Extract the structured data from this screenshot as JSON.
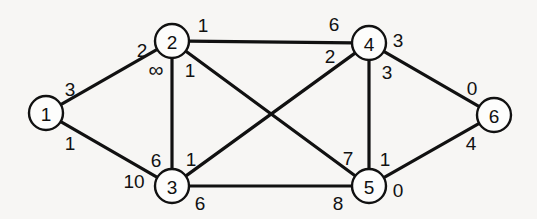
{
  "figure": {
    "type": "undirected-weighted-graph",
    "background_color": "#f7f6f4",
    "stroke_color": "#111111",
    "node_fill_color": "#fdfdfc"
  },
  "chart_data": {
    "type": "diagram",
    "title": "",
    "xlabel": "",
    "ylabel": "",
    "nodes": [
      {
        "id": "1",
        "label": "1",
        "x": 46,
        "y": 113,
        "r": 17
      },
      {
        "id": "2",
        "label": "2",
        "x": 172,
        "y": 41,
        "r": 17
      },
      {
        "id": "3",
        "label": "3",
        "x": 172,
        "y": 186,
        "r": 17
      },
      {
        "id": "4",
        "label": "4",
        "x": 369,
        "y": 43,
        "r": 17
      },
      {
        "id": "5",
        "label": "5",
        "x": 369,
        "y": 186,
        "r": 17
      },
      {
        "id": "6",
        "label": "6",
        "x": 494,
        "y": 115,
        "r": 17
      }
    ],
    "edges": [
      {
        "id": "edge-1-2",
        "from": "1",
        "to": "2",
        "label_from": "3",
        "label_to": "2"
      },
      {
        "id": "edge-1-3",
        "from": "1",
        "to": "3",
        "label_from": "1",
        "label_to": "10"
      },
      {
        "id": "edge-2-3",
        "from": "2",
        "to": "3",
        "label_from": "∞",
        "label_to": "6"
      },
      {
        "id": "edge-2-4",
        "from": "2",
        "to": "4",
        "label_from": "1",
        "label_to": "6"
      },
      {
        "id": "edge-2-5",
        "from": "2",
        "to": "5",
        "label_from": "1",
        "label_to": "7"
      },
      {
        "id": "edge-3-4",
        "from": "3",
        "to": "4",
        "label_from": "1",
        "label_to": "2"
      },
      {
        "id": "edge-3-5",
        "from": "3",
        "to": "5",
        "label_from": "6",
        "label_to": "8"
      },
      {
        "id": "edge-4-5",
        "from": "4",
        "to": "5",
        "label_from": "3",
        "label_to": "1"
      },
      {
        "id": "edge-4-6",
        "from": "4",
        "to": "6",
        "label_from": "3",
        "label_to": "0"
      },
      {
        "id": "edge-5-6",
        "from": "5",
        "to": "6",
        "label_from": "0",
        "label_to": "4"
      }
    ],
    "weight_labels": [
      {
        "id": "w-1-2-near1",
        "text": "3",
        "x": 70,
        "y": 89,
        "edge": "edge-1-2"
      },
      {
        "id": "w-1-2-near2",
        "text": "2",
        "x": 142,
        "y": 50,
        "edge": "edge-1-2"
      },
      {
        "id": "w-1-3-near1",
        "text": "1",
        "x": 70,
        "y": 143,
        "edge": "edge-1-3"
      },
      {
        "id": "w-1-3-near3",
        "text": "10",
        "x": 134,
        "y": 181,
        "edge": "edge-1-3"
      },
      {
        "id": "w-2-3-near2",
        "text": "∞",
        "x": 156,
        "y": 69,
        "edge": "edge-2-3"
      },
      {
        "id": "w-2-3-near3",
        "text": "6",
        "x": 156,
        "y": 160,
        "edge": "edge-2-3"
      },
      {
        "id": "w-2-4-near2",
        "text": "1",
        "x": 203,
        "y": 25,
        "edge": "edge-2-4"
      },
      {
        "id": "w-2-4-near4",
        "text": "6",
        "x": 334,
        "y": 24,
        "edge": "edge-2-4"
      },
      {
        "id": "w-2-5-near2",
        "text": "1",
        "x": 190,
        "y": 70,
        "edge": "edge-2-5"
      },
      {
        "id": "w-2-5-near5",
        "text": "7",
        "x": 348,
        "y": 158,
        "edge": "edge-2-5"
      },
      {
        "id": "w-3-4-near3",
        "text": "1",
        "x": 191,
        "y": 159,
        "edge": "edge-3-4"
      },
      {
        "id": "w-3-4-near4",
        "text": "2",
        "x": 330,
        "y": 56,
        "edge": "edge-3-4"
      },
      {
        "id": "w-3-5-near3",
        "text": "6",
        "x": 200,
        "y": 203,
        "edge": "edge-3-5"
      },
      {
        "id": "w-3-5-near5",
        "text": "8",
        "x": 338,
        "y": 203,
        "edge": "edge-3-5"
      },
      {
        "id": "w-4-5-near4",
        "text": "3",
        "x": 387,
        "y": 72,
        "edge": "edge-4-5"
      },
      {
        "id": "w-4-5-near5",
        "text": "1",
        "x": 385,
        "y": 159,
        "edge": "edge-4-5"
      },
      {
        "id": "w-4-6-near4",
        "text": "3",
        "x": 398,
        "y": 40,
        "edge": "edge-4-6"
      },
      {
        "id": "w-4-6-near6",
        "text": "0",
        "x": 472,
        "y": 88,
        "edge": "edge-4-6"
      },
      {
        "id": "w-5-6-near5",
        "text": "0",
        "x": 398,
        "y": 190,
        "edge": "edge-5-6"
      },
      {
        "id": "w-5-6-near6",
        "text": "4",
        "x": 471,
        "y": 143,
        "edge": "edge-5-6"
      }
    ]
  }
}
